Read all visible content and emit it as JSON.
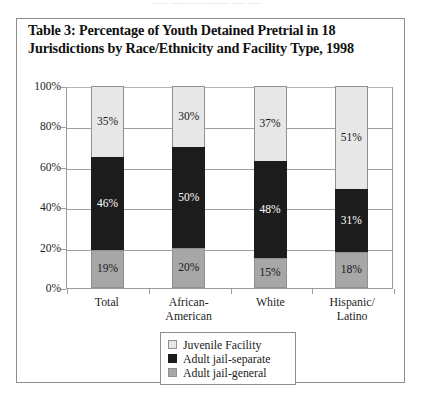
{
  "clipped_top_text": "— — ———————— —— ——",
  "table": {
    "title_line1": "Table 3: Percentage of Youth Detained Pretrial in 18",
    "title_line2": "Jurisdictions by Race/Ethnicity and Facility Type, 1998"
  },
  "colors": {
    "juvenile_facility": "#e7e7e7",
    "adult_jail_separate": "#1c1c1c",
    "adult_jail_general": "#a7a7a7",
    "frame": "#8d8d94",
    "gridline": "#9d9da2"
  },
  "axis": {
    "y_ticks": [
      "100%",
      "80%",
      "60%",
      "40%",
      "20%",
      "0%"
    ]
  },
  "legend": {
    "items": [
      {
        "label": "Juvenile Facility",
        "key": "juvenile"
      },
      {
        "label": "Adult jail-separate",
        "key": "separate"
      },
      {
        "label": "Adult jail-general",
        "key": "general"
      }
    ]
  },
  "chart_data": {
    "type": "bar",
    "stacked": true,
    "title": "Table 3: Percentage of Youth Detained Pretrial in 18 Jurisdictions by Race/Ethnicity and Facility Type, 1998",
    "xlabel": "",
    "ylabel": "",
    "ylim": [
      0,
      100
    ],
    "y_tick_step": 20,
    "grid": true,
    "legend_position": "bottom-center",
    "categories": [
      "Total",
      "African-American",
      "White",
      "Hispanic/Latino"
    ],
    "category_label_lines": [
      [
        "Total"
      ],
      [
        "African-",
        "American"
      ],
      [
        "White"
      ],
      [
        "Hispanic/",
        "Latino"
      ]
    ],
    "series": [
      {
        "name": "Juvenile Facility",
        "color": "#e7e7e7",
        "values": [
          35,
          30,
          37,
          51
        ],
        "labels": [
          "35%",
          "30%",
          "37%",
          "51%"
        ]
      },
      {
        "name": "Adult jail-separate",
        "color": "#1c1c1c",
        "values": [
          46,
          50,
          48,
          31
        ],
        "labels": [
          "46%",
          "50%",
          "48%",
          "31%"
        ]
      },
      {
        "name": "Adult jail-general",
        "color": "#a7a7a7",
        "values": [
          19,
          20,
          15,
          18
        ],
        "labels": [
          "19%",
          "20%",
          "15%",
          "18%"
        ]
      }
    ],
    "column_totals": [
      100,
      100,
      100,
      100
    ]
  }
}
